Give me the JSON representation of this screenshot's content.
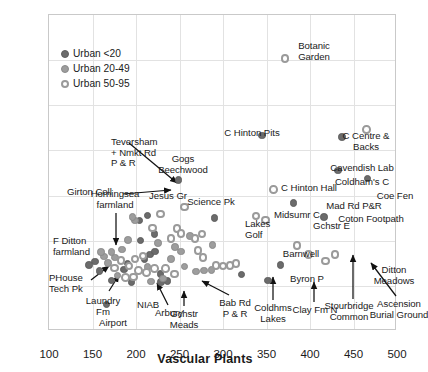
{
  "chart_data": {
    "type": "scatter",
    "title": "",
    "xlabel": "Vascular Plants",
    "ylabel": "Bryophytes",
    "xlim": [
      100,
      500
    ],
    "ylim": [
      30,
      100
    ],
    "xticks": [
      100,
      150,
      200,
      250,
      300,
      350,
      400,
      450,
      500
    ],
    "yticks": [
      30,
      40,
      50,
      60,
      70,
      80,
      90,
      100
    ],
    "grid": true,
    "legend_position": "upper-left inside",
    "legend": [
      {
        "label": "Urban <20",
        "marker": "filled-dark"
      },
      {
        "label": "Urban 20-49",
        "marker": "filled-mid"
      },
      {
        "label": "Urban 50-95",
        "marker": "open"
      }
    ],
    "series": [
      {
        "name": "Urban <20",
        "marker": "filled-dark",
        "points": [
          {
            "label": "Gogs Beechwood",
            "x": 249,
            "y": 63.4
          },
          {
            "label": "C Hinton Pits",
            "x": 345,
            "y": 73.3
          },
          {
            "label": "Cavendish Lab",
            "x": 437,
            "y": 73.0
          },
          {
            "label": "Coldham's C",
            "x": 432,
            "y": 65.5
          },
          {
            "label": "Coe Fen",
            "x": 466,
            "y": 63.8
          },
          {
            "label": "Mad Rd P&R",
            "x": 381,
            "y": 58.4
          },
          {
            "label": "Coton Footpath",
            "x": 416,
            "y": 55.3
          },
          {
            "label": "Lakes Golf",
            "x": 290,
            "y": 55.0
          },
          {
            "label": "Byron P",
            "x": 366,
            "y": 44.6
          },
          {
            "label": "Clay Fm N",
            "x": 352,
            "y": 41.2
          },
          {
            "label": "Coldhms Lakes",
            "x": 321,
            "y": 42.5
          },
          {
            "label": "Bab Rd P & R",
            "x": 236,
            "y": 41.1
          },
          {
            "label": "Gchstr Meads",
            "x": 229,
            "y": 40.8
          },
          {
            "label": "Airport",
            "x": 166,
            "y": 35.9
          },
          {
            "label": "Laundry Fm",
            "x": 172,
            "y": 41.2
          },
          {
            "label": "PHouse Tech Pk",
            "x": 153,
            "y": 45.4
          },
          {
            "label": "",
            "x": 146,
            "y": 44.6
          },
          {
            "label": "",
            "x": 158,
            "y": 43.3
          },
          {
            "label": "",
            "x": 186,
            "y": 43.6
          },
          {
            "label": "",
            "x": 190,
            "y": 45.0
          },
          {
            "label": "",
            "x": 210,
            "y": 46.0
          },
          {
            "label": "",
            "x": 216,
            "y": 47.0
          },
          {
            "label": "",
            "x": 222,
            "y": 47.6
          },
          {
            "label": "",
            "x": 205,
            "y": 50.0
          },
          {
            "label": "",
            "x": 221,
            "y": 51.5
          },
          {
            "label": "",
            "x": 204,
            "y": 54.5
          },
          {
            "label": "",
            "x": 213,
            "y": 55.6
          },
          {
            "label": "",
            "x": 228,
            "y": 42.6
          },
          {
            "label": "",
            "x": 195,
            "y": 40.9
          }
        ]
      },
      {
        "name": "Urban 20-49",
        "marker": "filled-mid",
        "points": [
          {
            "label": "Teversham + Nmkt Rd P & R",
            "x": 199,
            "y": 54.5
          },
          {
            "label": "Girton Coll",
            "x": 196,
            "y": 55.2
          },
          {
            "label": "",
            "x": 191,
            "y": 50.2
          },
          {
            "label": "",
            "x": 184,
            "y": 48.1
          },
          {
            "label": "",
            "x": 176,
            "y": 46.3
          },
          {
            "label": "",
            "x": 168,
            "y": 45.1
          },
          {
            "label": "",
            "x": 163,
            "y": 46.5
          },
          {
            "label": "Horningsea farmland",
            "x": 172,
            "y": 47.5
          },
          {
            "label": "F Ditton farmland",
            "x": 160,
            "y": 47.5
          },
          {
            "label": "NIAB",
            "x": 179,
            "y": 42.3
          },
          {
            "label": "Arbury",
            "x": 217,
            "y": 41.0
          },
          {
            "label": "",
            "x": 231,
            "y": 41.6
          },
          {
            "label": "",
            "x": 240,
            "y": 46.0
          },
          {
            "label": "",
            "x": 245,
            "y": 48.6
          },
          {
            "label": "",
            "x": 252,
            "y": 47.6
          },
          {
            "label": "",
            "x": 262,
            "y": 51.0
          },
          {
            "label": "",
            "x": 256,
            "y": 44.3
          },
          {
            "label": "",
            "x": 269,
            "y": 43.2
          },
          {
            "label": "",
            "x": 278,
            "y": 43.4
          },
          {
            "label": "",
            "x": 287,
            "y": 43.5
          },
          {
            "label": "",
            "x": 288,
            "y": 49.0
          },
          {
            "label": "",
            "x": 213,
            "y": 44.2
          },
          {
            "label": "",
            "x": 225,
            "y": 49.5
          }
        ]
      },
      {
        "name": "Urban 50-95",
        "marker": "open",
        "points": [
          {
            "label": "Botanic Garden",
            "x": 371,
            "y": 90.4
          },
          {
            "label": "C Centre & Backs",
            "x": 465,
            "y": 74.6
          },
          {
            "label": "C Hinton Hall",
            "x": 358,
            "y": 61.3
          },
          {
            "label": "Science Pk",
            "x": 256,
            "y": 57.5
          },
          {
            "label": "Midsumr C",
            "x": 338,
            "y": 55.5
          },
          {
            "label": "Gchstr E",
            "x": 349,
            "y": 54.6
          },
          {
            "label": "Barnwell",
            "x": 385,
            "y": 48.9
          },
          {
            "label": "Stourbridge Common",
            "x": 398,
            "y": 47.0
          },
          {
            "label": "Ascension Burial Ground",
            "x": 418,
            "y": 45.5
          },
          {
            "label": "Ditton Meadows",
            "x": 429,
            "y": 46.9
          },
          {
            "label": "Jesus Gr",
            "x": 228,
            "y": 55.9
          },
          {
            "label": "",
            "x": 219,
            "y": 52.8
          },
          {
            "label": "",
            "x": 247,
            "y": 52.7
          },
          {
            "label": "",
            "x": 252,
            "y": 51.6
          },
          {
            "label": "",
            "x": 240,
            "y": 50.5
          },
          {
            "label": "",
            "x": 268,
            "y": 50.5
          },
          {
            "label": "",
            "x": 276,
            "y": 51.5
          },
          {
            "label": "",
            "x": 271,
            "y": 47.8
          },
          {
            "label": "",
            "x": 277,
            "y": 46.3
          },
          {
            "label": "",
            "x": 292,
            "y": 44.5
          },
          {
            "label": "",
            "x": 300,
            "y": 44.4
          },
          {
            "label": "",
            "x": 308,
            "y": 44.5
          },
          {
            "label": "",
            "x": 315,
            "y": 44.9
          },
          {
            "label": "",
            "x": 208,
            "y": 46.6
          },
          {
            "label": "",
            "x": 199,
            "y": 46.0
          },
          {
            "label": "",
            "x": 192,
            "y": 44.4
          },
          {
            "label": "",
            "x": 183,
            "y": 45.6
          },
          {
            "label": "",
            "x": 175,
            "y": 44.0
          },
          {
            "label": "",
            "x": 203,
            "y": 43.4
          },
          {
            "label": "",
            "x": 212,
            "y": 43.0
          },
          {
            "label": "",
            "x": 221,
            "y": 43.9
          },
          {
            "label": "",
            "x": 234,
            "y": 43.8
          },
          {
            "label": "",
            "x": 244,
            "y": 42.6
          },
          {
            "label": "",
            "x": 188,
            "y": 41.8
          },
          {
            "label": "",
            "x": 197,
            "y": 42.0
          }
        ]
      }
    ],
    "annotations": [
      {
        "text": "Teversham\n+ Nmkt Rd\nP & R",
        "align": "left"
      },
      {
        "text": "Gogs\nBeechwood",
        "align": "center"
      },
      {
        "text": "Girton Coll",
        "align": "left"
      },
      {
        "text": "Horningsea\nfarmland",
        "align": "center"
      },
      {
        "text": "F Ditton\nfarmland",
        "align": "left"
      },
      {
        "text": "PHouse\nTech Pk",
        "align": "left"
      },
      {
        "text": "Laundry\nFm",
        "align": "center"
      },
      {
        "text": "NIAB",
        "align": "left"
      },
      {
        "text": "Airport",
        "align": "center"
      },
      {
        "text": "Arbury",
        "align": "center"
      },
      {
        "text": "Gchstr\nMeads",
        "align": "center"
      },
      {
        "text": "Bab Rd\nP & R",
        "align": "center"
      },
      {
        "text": "Coldhms\nLakes",
        "align": "center"
      },
      {
        "text": "Clay Fm N",
        "align": "center"
      },
      {
        "text": "Jesus Gr",
        "align": "center"
      },
      {
        "text": "Science Pk",
        "align": "center"
      },
      {
        "text": "Lakes\nGolf",
        "align": "left"
      },
      {
        "text": "Midsumr C",
        "align": "center"
      },
      {
        "text": "Gchstr E",
        "align": "left"
      },
      {
        "text": "Barnwell",
        "align": "center"
      },
      {
        "text": "Byron P",
        "align": "center"
      },
      {
        "text": "Stourbridge\nCommon",
        "align": "center"
      },
      {
        "text": "Ascension\nBurial Ground",
        "align": "center"
      },
      {
        "text": "Ditton\nMeadows",
        "align": "center"
      },
      {
        "text": "C Hinton Pits",
        "align": "center"
      },
      {
        "text": "C Hinton Hall",
        "align": "center"
      },
      {
        "text": "Botanic\nGarden",
        "align": "center"
      },
      {
        "text": "C Centre &\nBacks",
        "align": "center"
      },
      {
        "text": "Cavendish Lab",
        "align": "center"
      },
      {
        "text": "Coldham's C",
        "align": "center"
      },
      {
        "text": "Coe Fen",
        "align": "center"
      },
      {
        "text": "Mad Rd P&R",
        "align": "center"
      },
      {
        "text": "Coton Footpath",
        "align": "center"
      }
    ]
  },
  "axes": {
    "ylabel": "Bryophytes",
    "xlabel": "Vascular Plants",
    "yticks": [
      "100",
      "90",
      "80",
      "70",
      "60",
      "50",
      "40",
      "30"
    ],
    "xticks": [
      "100",
      "150",
      "200",
      "250",
      "300",
      "350",
      "400",
      "450",
      "500"
    ]
  },
  "legend": {
    "items": [
      {
        "label": "Urban <20",
        "style": "dark"
      },
      {
        "label": "Urban 20-49",
        "style": "mid"
      },
      {
        "label": "Urban 50-95",
        "style": "open"
      }
    ]
  },
  "labels": {
    "teversham": "Teversham\n+ Nmkt Rd\nP & R",
    "gogs": "Gogs\nBeechwood",
    "girton": "Girton Coll",
    "horningsea": "Horningsea\nfarmland",
    "fditton": "F Ditton\nfarmland",
    "phouse": "PHouse\nTech Pk",
    "laundry": "Laundry\nFm",
    "niab": "NIAB",
    "airport": "Airport",
    "arbury": "Arbury",
    "gchstr_meads": "Gchstr\nMeads",
    "bab_rd": "Bab Rd\nP & R",
    "coldhms_lakes": "Coldhms\nLakes",
    "clay_fm": "Clay Fm N",
    "jesus_gr": "Jesus Gr",
    "science_pk": "Science Pk",
    "lakes_golf": "Lakes\nGolf",
    "midsumr": "Midsumr C",
    "gchstr_e": "Gchstr E",
    "barnwell": "Barnwell",
    "byron": "Byron P",
    "stourbridge": "Stourbridge\nCommon",
    "ascension": "Ascension\nBurial Ground",
    "ditton": "Ditton\nMeadows",
    "hinton_pits": "C Hinton Pits",
    "hinton_hall": "C Hinton Hall",
    "botanic": "Botanic\nGarden",
    "ccentre": "C Centre &\nBacks",
    "cavendish": "Cavendish Lab",
    "coldhams_c": "Coldham's C",
    "coe_fen": "Coe Fen",
    "mad_rd": "Mad Rd P&R",
    "coton": "Coton Footpath"
  }
}
